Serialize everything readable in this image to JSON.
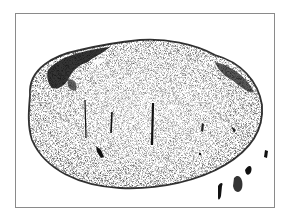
{
  "figure": {
    "style": "stippled black-and-white illustration",
    "incisions": 3,
    "colors": {
      "ink": "#111111",
      "paper": "#ffffff",
      "frame": "#8a8a8a"
    }
  }
}
